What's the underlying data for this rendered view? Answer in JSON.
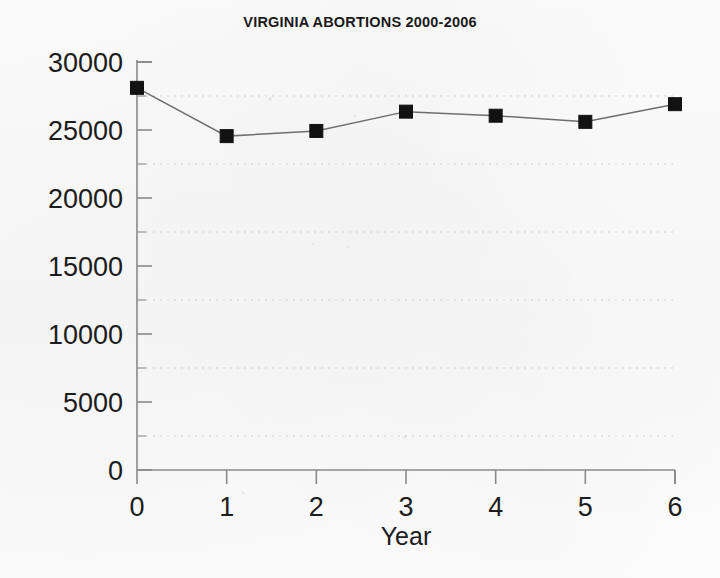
{
  "chart_data": {
    "type": "line",
    "title": "VIRGINIA ABORTIONS 2000-2006",
    "xlabel": "Year",
    "ylabel": "",
    "x": [
      0,
      1,
      2,
      3,
      4,
      5,
      6
    ],
    "values": [
      28100,
      24550,
      24930,
      26350,
      26050,
      25600,
      26900
    ],
    "series": [
      {
        "name": "Virginia abortions",
        "values": [
          28100,
          24550,
          24930,
          26350,
          26050,
          25600,
          26900
        ]
      }
    ],
    "xtick_labels": [
      "0",
      "1",
      "2",
      "3",
      "4",
      "5",
      "6"
    ],
    "ytick_labels": [
      "0",
      "5000",
      "10000",
      "15000",
      "20000",
      "25000",
      "30000"
    ],
    "ytick_values": [
      0,
      5000,
      10000,
      15000,
      20000,
      25000,
      30000
    ],
    "yminor_values": [
      2500,
      7500,
      12500,
      17500,
      22500,
      27500
    ],
    "xlim": [
      0,
      6
    ],
    "ylim": [
      0,
      30000
    ],
    "grid": "horizontal-dotted-at-minor-ticks",
    "legend": "none",
    "marker": "filled-square",
    "marker_color": "#121212",
    "line_color": "#6e6e6e",
    "axis_color": "#8a8a8a",
    "gridline_color": "#cfcfcf",
    "background_color": "#fcfcfc"
  }
}
